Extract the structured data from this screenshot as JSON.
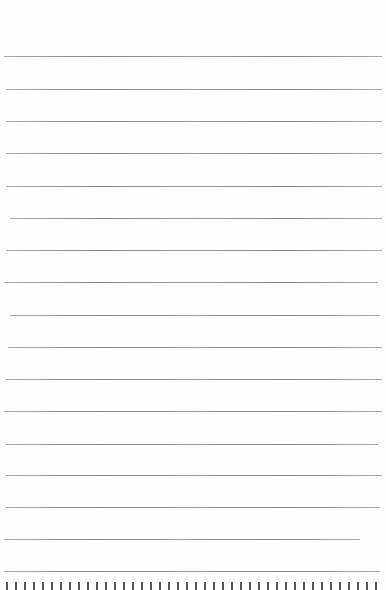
{
  "document": {
    "type": "ruled-paper-page",
    "background_color": "#fefefe",
    "line_color": "#7a7a7a",
    "rules": [
      {
        "y": 56,
        "x1": 4,
        "x2": 382
      },
      {
        "y": 89,
        "x1": 6,
        "x2": 382
      },
      {
        "y": 121,
        "x1": 6,
        "x2": 382
      },
      {
        "y": 153,
        "x1": 6,
        "x2": 382
      },
      {
        "y": 186,
        "x1": 6,
        "x2": 382
      },
      {
        "y": 218,
        "x1": 10,
        "x2": 382
      },
      {
        "y": 250,
        "x1": 6,
        "x2": 382
      },
      {
        "y": 282,
        "x1": 4,
        "x2": 378
      },
      {
        "y": 315,
        "x1": 10,
        "x2": 380
      },
      {
        "y": 347,
        "x1": 8,
        "x2": 382
      },
      {
        "y": 379,
        "x1": 6,
        "x2": 382
      },
      {
        "y": 411,
        "x1": 4,
        "x2": 382
      },
      {
        "y": 444,
        "x1": 6,
        "x2": 378
      },
      {
        "y": 475,
        "x1": 6,
        "x2": 382
      },
      {
        "y": 507,
        "x1": 6,
        "x2": 380
      },
      {
        "y": 539,
        "x1": 4,
        "x2": 360
      },
      {
        "y": 571,
        "x1": 4,
        "x2": 380
      }
    ],
    "footer_text": "(text cut off at bottom edge — illegible)"
  }
}
